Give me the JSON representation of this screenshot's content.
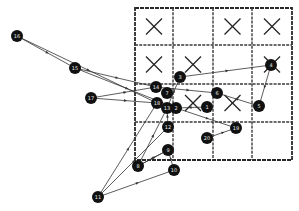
{
  "diagram": {
    "title": "",
    "grid": {
      "rows": 4,
      "cols": 4,
      "x_marks": [
        {
          "row": 0,
          "col": 0
        },
        {
          "row": 0,
          "col": 2
        },
        {
          "row": 0,
          "col": 3
        },
        {
          "row": 1,
          "col": 0
        },
        {
          "row": 1,
          "col": 1
        },
        {
          "row": 1,
          "col": 3
        },
        {
          "row": 2,
          "col": 1
        },
        {
          "row": 2,
          "col": 2
        }
      ]
    },
    "nodes": [
      {
        "id": "1",
        "label": "1"
      },
      {
        "id": "2",
        "label": "2"
      },
      {
        "id": "3",
        "label": "3"
      },
      {
        "id": "4",
        "label": "4"
      },
      {
        "id": "5",
        "label": "5"
      },
      {
        "id": "6",
        "label": "6"
      },
      {
        "id": "7",
        "label": "7"
      },
      {
        "id": "8",
        "label": "8"
      },
      {
        "id": "9",
        "label": "9"
      },
      {
        "id": "10",
        "label": "10"
      },
      {
        "id": "11",
        "label": "11"
      },
      {
        "id": "12",
        "label": "12"
      },
      {
        "id": "13",
        "label": "13"
      },
      {
        "id": "14",
        "label": "14"
      },
      {
        "id": "15",
        "label": "15"
      },
      {
        "id": "16",
        "label": "16"
      },
      {
        "id": "17",
        "label": "17"
      },
      {
        "id": "18",
        "label": "18"
      },
      {
        "id": "19",
        "label": "19"
      },
      {
        "id": "20",
        "label": "20"
      }
    ],
    "edges": [
      {
        "from": "16",
        "to": "15"
      },
      {
        "from": "16",
        "to": "18"
      },
      {
        "from": "15",
        "to": "14"
      },
      {
        "from": "15",
        "to": "2"
      },
      {
        "from": "17",
        "to": "14"
      },
      {
        "from": "17",
        "to": "18"
      },
      {
        "from": "3",
        "to": "4"
      },
      {
        "from": "13",
        "to": "3"
      },
      {
        "from": "4",
        "to": "5"
      },
      {
        "from": "5",
        "to": "6"
      },
      {
        "from": "14",
        "to": "6"
      },
      {
        "from": "1",
        "to": "2"
      },
      {
        "from": "2",
        "to": "19"
      },
      {
        "from": "20",
        "to": "19"
      },
      {
        "from": "11",
        "to": "18"
      },
      {
        "from": "11",
        "to": "12"
      },
      {
        "from": "11",
        "to": "10"
      },
      {
        "from": "10",
        "to": "9"
      },
      {
        "from": "8",
        "to": "9"
      },
      {
        "from": "8",
        "to": "13"
      },
      {
        "from": "12",
        "to": "13"
      },
      {
        "from": "9",
        "to": "8"
      }
    ]
  }
}
